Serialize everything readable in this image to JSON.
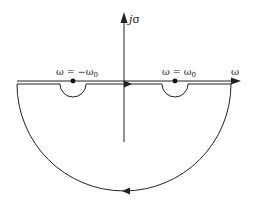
{
  "diagram": {
    "type": "contour-in-complex-plane",
    "axes": {
      "horizontal_label": "ω",
      "vertical_label_j": "j",
      "vertical_label_sigma": "σ"
    },
    "singularities": [
      {
        "label": "ω = −ω",
        "subscript": "0",
        "x": 73
      },
      {
        "label": "ω = ω",
        "subscript": "0",
        "x": 175
      }
    ],
    "contour": {
      "direction_top": "left-to-right",
      "direction_bottom": "right-to-left",
      "indentation": "small semicircles below real axis around each singularity",
      "closure": "large semicircle in lower half-plane"
    },
    "colors": {
      "stroke": "#222222",
      "background": "#ffffff"
    }
  }
}
